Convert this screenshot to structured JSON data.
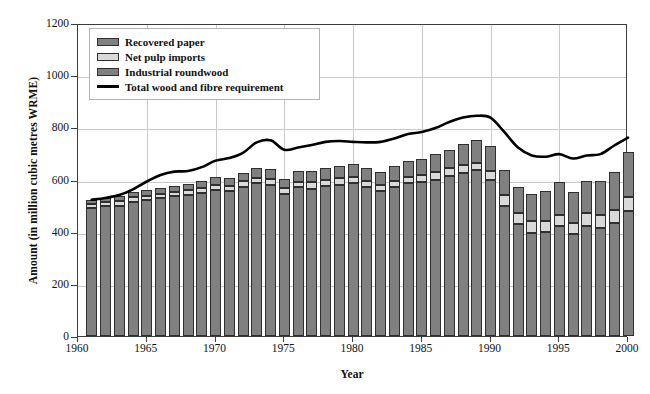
{
  "chart_data": {
    "type": "bar",
    "title": "",
    "subtitle": "",
    "xlabel": "Year",
    "ylabel": "Amount (in million cubic metres WRME)",
    "xlim": [
      1960,
      2000
    ],
    "ylim": [
      0,
      1200
    ],
    "ytick_labels": [
      "0",
      "200",
      "400",
      "600",
      "800",
      "1000",
      "1200"
    ],
    "yticks": [
      0,
      200,
      400,
      600,
      800,
      1000,
      1200
    ],
    "xtick_labels": [
      "1960",
      "1965",
      "1970",
      "1975",
      "1980",
      "1985",
      "1990",
      "1995",
      "2000"
    ],
    "xticks": [
      1960,
      1965,
      1970,
      1975,
      1980,
      1985,
      1990,
      1995,
      2000
    ],
    "grid": true,
    "stacked": true,
    "legend_position": "top-left",
    "legend_entries": [
      {
        "label": "Recovered paper",
        "type": "swatch",
        "color": "#808080"
      },
      {
        "label": "Net pulp imports",
        "type": "swatch",
        "color": "#d9d9d9"
      },
      {
        "label": "Industrial roundwood",
        "type": "swatch",
        "color": "#808080"
      },
      {
        "label": "Total wood and fibre requirement",
        "type": "line",
        "color": "#000000"
      }
    ],
    "categories": [
      1961,
      1962,
      1963,
      1964,
      1965,
      1966,
      1967,
      1968,
      1969,
      1970,
      1971,
      1972,
      1973,
      1974,
      1975,
      1976,
      1977,
      1978,
      1979,
      1980,
      1981,
      1982,
      1983,
      1984,
      1985,
      1986,
      1987,
      1988,
      1989,
      1990,
      1991,
      1992,
      1993,
      1994,
      1995,
      1996,
      1997,
      1998,
      1999,
      2000
    ],
    "series": [
      {
        "name": "Industrial roundwood",
        "color": "#808080",
        "values": [
          490,
          498,
          500,
          515,
          520,
          528,
          535,
          540,
          548,
          560,
          555,
          572,
          585,
          580,
          545,
          570,
          565,
          575,
          580,
          585,
          570,
          555,
          572,
          585,
          590,
          600,
          615,
          625,
          635,
          600,
          500,
          430,
          395,
          400,
          420,
          390,
          420,
          415,
          435,
          480
        ]
      },
      {
        "name": "Net pulp imports",
        "color": "#d9d9d9",
        "values": [
          15,
          15,
          16,
          18,
          18,
          18,
          18,
          18,
          18,
          20,
          20,
          22,
          22,
          22,
          22,
          22,
          24,
          24,
          24,
          24,
          24,
          24,
          24,
          26,
          26,
          28,
          28,
          30,
          30,
          34,
          40,
          42,
          45,
          40,
          44,
          44,
          50,
          50,
          50,
          52
        ]
      },
      {
        "name": "Recovered paper",
        "color": "#808080",
        "values": [
          15,
          17,
          19,
          20,
          22,
          22,
          23,
          25,
          27,
          30,
          30,
          32,
          38,
          40,
          35,
          42,
          44,
          45,
          48,
          52,
          50,
          50,
          54,
          60,
          62,
          68,
          72,
          80,
          85,
          95,
          95,
          100,
          105,
          115,
          125,
          120,
          125,
          130,
          145,
          175
        ]
      }
    ],
    "line_series": {
      "name": "Total wood and fibre requirement",
      "color": "#000000",
      "x": [
        1961,
        1962,
        1963,
        1964,
        1965,
        1966,
        1967,
        1968,
        1969,
        1970,
        1971,
        1972,
        1973,
        1974,
        1975,
        1976,
        1977,
        1978,
        1979,
        1980,
        1981,
        1982,
        1983,
        1984,
        1985,
        1986,
        1987,
        1988,
        1989,
        1990,
        1991,
        1992,
        1993,
        1994,
        1995,
        1996,
        1997,
        1998,
        1999,
        2000
      ],
      "values": [
        530,
        537,
        548,
        570,
        600,
        625,
        638,
        640,
        655,
        680,
        690,
        710,
        750,
        758,
        722,
        730,
        740,
        752,
        755,
        752,
        750,
        752,
        765,
        782,
        790,
        805,
        828,
        845,
        852,
        845,
        790,
        730,
        700,
        695,
        705,
        688,
        700,
        705,
        738,
        768
      ]
    }
  }
}
